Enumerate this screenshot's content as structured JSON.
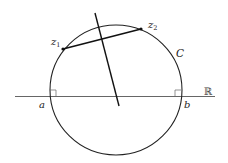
{
  "diagram": {
    "colors": {
      "stroke": "#222222",
      "axis": "#555555",
      "background": "#ffffff"
    },
    "labels": {
      "z1": "z",
      "z1_sub": "1",
      "z2": "z",
      "z2_sub": "2",
      "circle": "C",
      "a": "a",
      "b": "b",
      "real_line": "ℝ"
    },
    "geometry": {
      "circle": {
        "cx": 116,
        "cy": 90,
        "r": 66
      },
      "real_line": {
        "x1": 15,
        "y1": 96,
        "x2": 215,
        "y2": 96
      },
      "point_z1": {
        "x": 63,
        "y": 49
      },
      "point_z2": {
        "x": 141,
        "y": 29
      },
      "bisector": {
        "x1": 95,
        "y1": 13,
        "x2": 119,
        "y2": 106
      },
      "intersection_a": {
        "x": 50,
        "y": 96
      },
      "intersection_b": {
        "x": 181,
        "y": 96
      }
    }
  }
}
